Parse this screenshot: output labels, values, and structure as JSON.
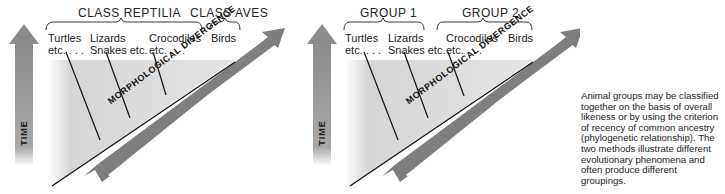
{
  "panels": [
    {
      "id": "phenetic",
      "groups": [
        {
          "label": "CLASS REPTILIA"
        },
        {
          "label": "CLASS AVES"
        }
      ],
      "taxa": [
        {
          "line1": "Turtles",
          "line2": "etc. . . ."
        },
        {
          "line1": "Lizards",
          "line2": "Snakes etc."
        },
        {
          "line1": "Crocodiles",
          "line2": "etc. . . ."
        },
        {
          "line1": "Birds",
          "line2": ""
        }
      ],
      "time_label": "TIME",
      "divergence_label": "MORPHOLOGICAL DIVERGENCE"
    },
    {
      "id": "phylogenetic",
      "groups": [
        {
          "label": "GROUP 1"
        },
        {
          "label": "GROUP 2"
        }
      ],
      "taxa": [
        {
          "line1": "Turtles",
          "line2": "etc. . . ."
        },
        {
          "line1": "Lizards",
          "line2": "Snakes etc."
        },
        {
          "line1": "Crocodiles",
          "line2": "etc. . . ."
        },
        {
          "line1": "Birds",
          "line2": ""
        }
      ],
      "time_label": "TIME",
      "divergence_label": "MORPHOLOGICAL DIVERGENCE"
    }
  ],
  "caption": "Animal groups may be classified together on the basis of overall likeness or by using the criterion of recency of common ancestry (phylogenetic relationship). The two methods illustrate different evolutionary phenomena and often produce different groupings.",
  "colors": {
    "arrow_gray": "#8a8a8a",
    "background_shade": "#dcdcdc",
    "line": "#111111"
  }
}
